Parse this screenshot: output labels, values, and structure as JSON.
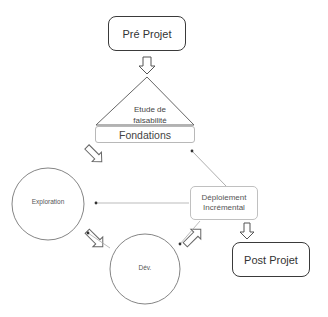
{
  "diagram": {
    "nodes": {
      "pre_projet": {
        "label": "Pré Projet",
        "shape": "rounded-rectangle"
      },
      "etude": {
        "label_line1": "Etude de",
        "label_line2": "faisabilité",
        "shape": "triangle"
      },
      "fondations": {
        "label": "Fondations",
        "shape": "rounded-rectangle"
      },
      "exploration": {
        "label": "Exploration",
        "shape": "circle"
      },
      "dev": {
        "label": "Dév.",
        "shape": "circle"
      },
      "deploiement": {
        "label_line1": "Déploiement",
        "label_line2": "Incrémental",
        "shape": "rounded-rectangle"
      },
      "post_projet": {
        "label": "Post Projet",
        "shape": "rounded-rectangle"
      }
    },
    "edges": [
      {
        "from": "pre_projet",
        "to": "etude",
        "style": "block-arrow"
      },
      {
        "from": "fondations",
        "to": "exploration",
        "style": "block-arrow"
      },
      {
        "from": "exploration",
        "to": "dev",
        "style": "block-arrow"
      },
      {
        "from": "dev",
        "to": "deploiement",
        "style": "block-arrow"
      },
      {
        "from": "deploiement",
        "to": "post_projet",
        "style": "block-arrow"
      },
      {
        "from": "deploiement",
        "to": "fondations",
        "style": "thin-line"
      },
      {
        "from": "deploiement",
        "to": "exploration",
        "style": "thin-line"
      },
      {
        "from": "deploiement",
        "to": "dev",
        "style": "thin-line"
      },
      {
        "from": "dev",
        "to": "exploration",
        "style": "thin-line"
      }
    ],
    "colors": {
      "stroke_dark": "#3a3a3a",
      "stroke_light": "#999999",
      "background": "#ffffff"
    }
  }
}
